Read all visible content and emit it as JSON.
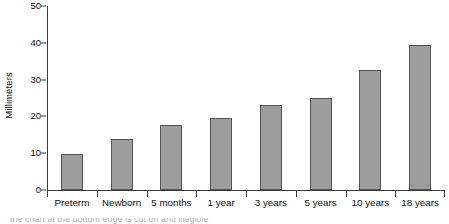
{
  "chart_data": {
    "type": "bar",
    "title": "",
    "xlabel": "",
    "ylabel": "Millimeters",
    "ylim": [
      0,
      50
    ],
    "yticks": [
      0,
      10,
      20,
      30,
      40,
      50
    ],
    "ytick_labels": [
      "0",
      "10",
      "20",
      "30",
      "40",
      "50"
    ],
    "grid": false,
    "legend": null,
    "categories": [
      "Preterm",
      "Newborn",
      "5 months",
      "1 year",
      "3 years",
      "5 years",
      "10 years",
      "18 years"
    ],
    "values": [
      9.8,
      13.9,
      17.8,
      19.7,
      23.2,
      25.1,
      32.5,
      39.3
    ],
    "colors": {
      "bar_fill": "#9d9d9d",
      "bar_border": "#545454",
      "axis": "#3a3a3a",
      "text": "#111111",
      "background": "#ffffff"
    }
  },
  "caption": {
    "cropped_text": "the chart at the bottom edge is cut off and illegible"
  }
}
